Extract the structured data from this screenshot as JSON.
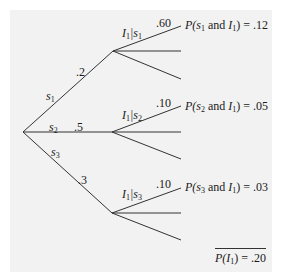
{
  "diagram": {
    "type": "probability-tree",
    "background_color": "#f2f2f2",
    "line_color": "#333333",
    "root": {
      "x": 23,
      "y": 132
    },
    "first_branches": [
      {
        "state": "s",
        "sub": "1",
        "prob": ".2",
        "node": {
          "x": 113,
          "y": 51
        }
      },
      {
        "state": "s",
        "sub": "2",
        "prob": ".5",
        "node": {
          "x": 112,
          "y": 132
        }
      },
      {
        "state": "s",
        "sub": "3",
        "prob": ".3",
        "node": {
          "x": 112,
          "y": 213
        }
      }
    ],
    "second_branches": [
      {
        "condition": "I",
        "cond_sub": "1",
        "given": "s",
        "given_sub": "1",
        "prob": ".60",
        "joint_prefix": "P(",
        "joint_state": "s",
        "joint_state_sub": "1",
        "joint_and": " and ",
        "joint_ind": "I",
        "joint_ind_sub": "1",
        "joint_value": ") = .12"
      },
      {
        "condition": "I",
        "cond_sub": "1",
        "given": "s",
        "given_sub": "2",
        "prob": ".10",
        "joint_prefix": "P(",
        "joint_state": "s",
        "joint_state_sub": "2",
        "joint_and": " and ",
        "joint_ind": "I",
        "joint_ind_sub": "1",
        "joint_value": ") = .05"
      },
      {
        "condition": "I",
        "cond_sub": "1",
        "given": "s",
        "given_sub": "3",
        "prob": ".10",
        "joint_prefix": "P(",
        "joint_state": "s",
        "joint_state_sub": "3",
        "joint_and": " and ",
        "joint_ind": "I",
        "joint_ind_sub": "1",
        "joint_value": ") = .03"
      }
    ],
    "total": {
      "prefix": "P(",
      "var": "I",
      "var_sub": "1",
      "value": ") = .20"
    }
  }
}
